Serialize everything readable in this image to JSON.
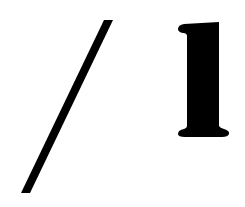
{
  "glyphs": [
    {
      "char": "/",
      "name": "slash",
      "color": "#000000"
    },
    {
      "char": "l",
      "name": "bold-serif-lowercase-l",
      "color": "#000000"
    }
  ],
  "text": "/ l",
  "background": "#ffffff"
}
